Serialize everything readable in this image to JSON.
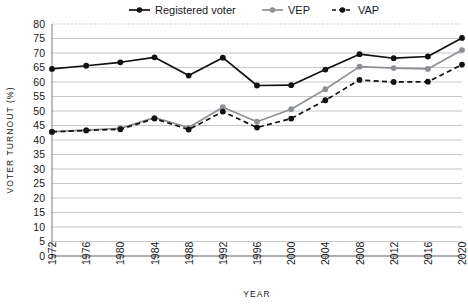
{
  "chart_data": {
    "type": "line",
    "title": "",
    "xlabel": "YEAR",
    "ylabel": "VOTER TURNOUT (%)",
    "categories": [
      "1972",
      "1976",
      "1980",
      "1984",
      "1988",
      "1992",
      "1996",
      "2000",
      "2004",
      "2008",
      "2012",
      "2016",
      "2020"
    ],
    "x": [
      1972,
      1976,
      1980,
      1984,
      1988,
      1992,
      1996,
      2000,
      2004,
      2008,
      2012,
      2016,
      2020
    ],
    "xlim": [
      1972,
      2020
    ],
    "ylim": [
      0,
      80
    ],
    "ytick_labels": [
      "80",
      "75",
      "70",
      "65",
      "60",
      "55",
      "50",
      "45",
      "40",
      "35",
      "30",
      "25",
      "20",
      "15",
      "10",
      "5",
      "0"
    ],
    "yticks": [
      80,
      75,
      70,
      65,
      60,
      55,
      50,
      45,
      40,
      35,
      30,
      25,
      20,
      15,
      10,
      5,
      0
    ],
    "grid": true,
    "legend_position": "top",
    "series": [
      {
        "name": "Registered voter",
        "color": "#111114",
        "style": "solid",
        "values": [
          64.5,
          65.6,
          66.8,
          68.5,
          62.2,
          68.4,
          58.8,
          58.9,
          64.3,
          69.6,
          68.2,
          68.8,
          75.2
        ]
      },
      {
        "name": "VEP",
        "color": "#8d9094",
        "style": "solid",
        "values": [
          42.9,
          43.4,
          44.0,
          47.7,
          44.3,
          51.3,
          46.3,
          50.6,
          57.5,
          65.3,
          64.8,
          64.5,
          71.0
        ]
      },
      {
        "name": "VAP",
        "color": "#111114",
        "style": "dashed",
        "values": [
          42.8,
          43.3,
          43.7,
          47.4,
          43.6,
          49.8,
          44.3,
          47.4,
          53.7,
          60.7,
          60.0,
          60.1,
          66.0
        ]
      }
    ]
  },
  "legend": {
    "items": [
      {
        "label": "Registered voter"
      },
      {
        "label": "VEP"
      },
      {
        "label": "VAP"
      }
    ]
  },
  "axes": {
    "x_title": "YEAR",
    "y_title": "VOTER TURNOUT (%)"
  }
}
